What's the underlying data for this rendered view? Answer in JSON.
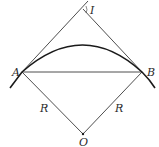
{
  "diagram": {
    "type": "circular-curve-geometry",
    "colors": {
      "stroke": "#3a3a3a",
      "arc": "#1a1a1a",
      "text": "#2a2a2a",
      "background": "#ffffff"
    },
    "points": {
      "A": {
        "label": "A",
        "x": 22,
        "y": 72
      },
      "B": {
        "label": "B",
        "x": 142,
        "y": 72
      },
      "I": {
        "label": "I",
        "x": 83,
        "y": 9
      },
      "O": {
        "label": "O",
        "x": 83,
        "y": 134
      }
    },
    "labels": {
      "I": "I",
      "A": "A",
      "B": "B",
      "O": "O",
      "radius_left": "R",
      "radius_right": "R"
    },
    "segments": [
      {
        "name": "tangent-AI",
        "from": "A",
        "to": "I"
      },
      {
        "name": "tangent-IB",
        "from": "I",
        "to": "B"
      },
      {
        "name": "chord-AB",
        "from": "A",
        "to": "B"
      },
      {
        "name": "radius-AO",
        "from": "A",
        "to": "O"
      },
      {
        "name": "radius-BO",
        "from": "B",
        "to": "O"
      }
    ],
    "arc": {
      "name": "circular-arc",
      "through": [
        "A",
        "B"
      ]
    }
  }
}
